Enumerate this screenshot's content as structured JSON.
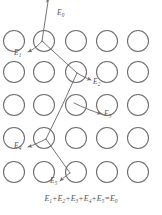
{
  "figure": {
    "type": "physics-schematic",
    "colors": {
      "background": "#ffffff",
      "circle_stroke": "#6f6b6b",
      "path_stroke": "#6f6b6b",
      "text": "#555151"
    },
    "lattice": {
      "rows": 5,
      "columns": 5,
      "circle_radius": 10.5,
      "row_centers_y": [
        41,
        72,
        105,
        138,
        172
      ],
      "column_centers_x": [
        14,
        44,
        76,
        107,
        138
      ]
    },
    "labels": [
      {
        "id": "E0",
        "base": "E",
        "sub": "0",
        "x": 57,
        "y": 13
      },
      {
        "id": "E1",
        "base": "E",
        "sub": "1",
        "x": 20,
        "y": 53
      },
      {
        "id": "E2",
        "base": "E",
        "sub": "2",
        "x": 93,
        "y": 81
      },
      {
        "id": "E3",
        "base": "E",
        "sub": "3",
        "x": 105,
        "y": 113
      },
      {
        "id": "E4",
        "base": "E",
        "sub": "4",
        "x": 19,
        "y": 145
      },
      {
        "id": "E5",
        "base": "E",
        "sub": "5",
        "x": 51,
        "y": 179
      }
    ],
    "equation": {
      "terms": [
        "E",
        "E",
        "E",
        "E",
        "E"
      ],
      "subs": [
        "1",
        "2",
        "3",
        "4",
        "5"
      ],
      "result_base": "E",
      "result_sub": "0",
      "plus": "+",
      "equals": "=",
      "text": "E1 + E2 + E3 + E4 + E5 = E0"
    },
    "path": {
      "description": "Incident particle E0 enters from top, scatters at four lattice sites losing E1..E5",
      "nodes": [
        {
          "x": 48,
          "y": -4
        },
        {
          "x": 42,
          "y": 41
        },
        {
          "x": 76,
          "y": 72
        },
        {
          "x": 63,
          "y": 105
        },
        {
          "x": 46,
          "y": 138
        },
        {
          "x": 69,
          "y": 172
        }
      ],
      "branches": [
        {
          "id": "E1-branch",
          "from": {
            "x": 42,
            "y": 41
          },
          "to": {
            "x": 27,
            "y": 52
          }
        },
        {
          "id": "E2-branch",
          "from": {
            "x": 76,
            "y": 72
          },
          "to": {
            "x": 90,
            "y": 80
          }
        },
        {
          "id": "E3-branch",
          "from": {
            "x": 86,
            "y": 105
          },
          "to": {
            "x": 101,
            "y": 113
          }
        },
        {
          "id": "E4-branch",
          "from": {
            "x": 46,
            "y": 138
          },
          "to": {
            "x": 27,
            "y": 146
          }
        },
        {
          "id": "E5-branch",
          "from": {
            "x": 69,
            "y": 172
          },
          "to": {
            "x": 59,
            "y": 180
          }
        }
      ]
    }
  }
}
